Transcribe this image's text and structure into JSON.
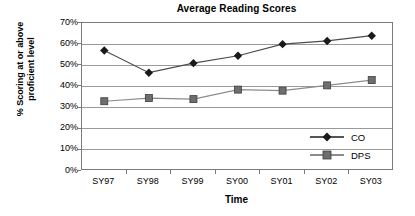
{
  "chart_data": {
    "type": "line",
    "title": "Average Reading Scores",
    "xlabel": "Time",
    "ylabel_line1": "% Scoring at or above",
    "ylabel_line2": "proficient level",
    "categories": [
      "SY97",
      "SY98",
      "SY99",
      "SY00",
      "SY01",
      "SY02",
      "SY03"
    ],
    "ylim": [
      0,
      70
    ],
    "ytick_labels": [
      "70%",
      "60%",
      "50%",
      "40%",
      "30%",
      "20%",
      "10%",
      "0%"
    ],
    "ytick_values": [
      70,
      60,
      50,
      40,
      30,
      20,
      10,
      0
    ],
    "grid": true,
    "legend_position": "inside lower-right",
    "series": [
      {
        "name": "CO",
        "marker": "diamond",
        "color": "#1a1a1a",
        "values": [
          57,
          46.5,
          51,
          54.5,
          60,
          61.5,
          64
        ]
      },
      {
        "name": "DPS",
        "marker": "square",
        "color": "#6e6e6e",
        "values": [
          33,
          34.5,
          34,
          38.5,
          38,
          40.5,
          43
        ]
      }
    ]
  },
  "colors": {
    "co_series": "#1a1a1a",
    "dps_series": "#6e6e6e",
    "gridline": "#9a9a9a",
    "axis": "#7a7a7a",
    "background": "#ffffff"
  }
}
